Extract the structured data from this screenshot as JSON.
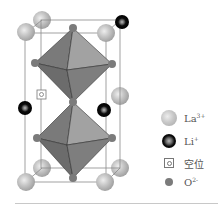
{
  "figure": {
    "type": "crystal-structure",
    "colors": {
      "octahedron_light": "#9a9a9a",
      "octahedron_dark": "#6e6e6e",
      "la_ion": "#c4c4c4",
      "li_ion": "#0a0a0a",
      "o_ion": "#7b7b7b",
      "frame": "#8a8a8a"
    }
  },
  "legend": {
    "items": [
      {
        "key": "La",
        "charge": "3+",
        "symbol": "la-ion"
      },
      {
        "key": "Li",
        "charge": "+",
        "symbol": "li-ion"
      },
      {
        "key": "空位",
        "charge": "",
        "symbol": "vacancy"
      },
      {
        "key": "O",
        "charge": "2-",
        "symbol": "o-ion"
      }
    ]
  }
}
